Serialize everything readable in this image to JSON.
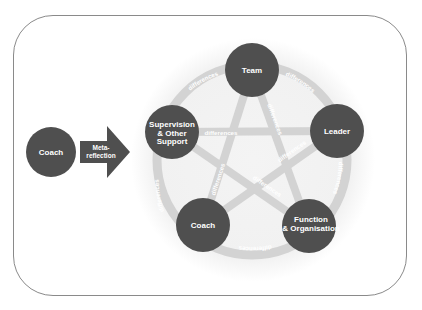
{
  "diagram": {
    "external": {
      "node_label": "Coach",
      "arrow_label_line1": "Meta-",
      "arrow_label_line2": "reflection"
    },
    "nodes": {
      "team": "Team",
      "leader": "Leader",
      "function_line1": "Function",
      "function_line2": "& Organisation",
      "coach": "Coach",
      "supervision_line1": "Supervision",
      "supervision_line2": "& Other",
      "supervision_line3": "Support"
    },
    "connector_label": "differences",
    "colors": {
      "node": "#4f4f4f",
      "band": "#d3d3d3",
      "halo": "#f1f1f1",
      "frame_border": "#8a8a8a"
    }
  }
}
